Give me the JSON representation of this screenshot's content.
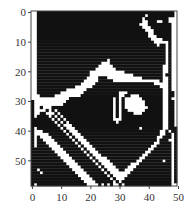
{
  "chart_data": {
    "type": "heatmap",
    "title": "",
    "xlabel": "",
    "ylabel": "",
    "colormap": "binary (black = 1, white = 0)",
    "colors": {
      "on": "#111111",
      "off": "#ffffff",
      "frame": "#444444"
    },
    "shape": [
      59,
      50
    ],
    "xlim": [
      -0.5,
      49.5
    ],
    "ylim": [
      58.5,
      -0.5
    ],
    "x_ticks": [
      0,
      10,
      20,
      30,
      40,
      50
    ],
    "y_ticks": [
      0,
      10,
      20,
      30,
      40,
      50
    ],
    "x_tick_labels": [
      "0",
      "10",
      "20",
      "30",
      "40",
      "50"
    ],
    "y_tick_labels": [
      "0",
      "10",
      "20",
      "30",
      "40",
      "50"
    ],
    "grid": false,
    "legend": null,
    "rows": [
      "00111111111111111111111111111111111111111111111110",
      "00111111111111111111111111111111111111101111111110",
      "00111111111111111111111111111111111111011111111000",
      "00111111111111111111111111111111111111001110011000",
      "00111111111111111111111111111111111110001111111100",
      "00111111111111111111111111111111111111000111111100",
      "00111111111111111111111111111111111111100011111100",
      "00111111111111111111111111111111111111110011111100",
      "00111111111111111111111111111111111111110001111100",
      "00111111111111111111111111111111111111111000011100",
      "00111111111111111111111111111111111111111100000100",
      "00111111111111111111111111111111111111111110110100",
      "00111111111111111111111111111111111111111111110100",
      "00111111111111111111111111111111111111111111110100",
      "00111111111111111111111111111111111111111111110100",
      "00111111111111111111111111111111111111111111110100",
      "00111111111111111111111111011111111111111111110100",
      "00111111111111111111111100011111111111111111110100",
      "00111111111111111111111000001111111111111111100100",
      "00111111111111111111110000000111111111111111100100",
      "00111111111111111111000000000000111111111111100100",
      "00111111111111111111000000000000000111111111101100",
      "00111111111111111110000111000000000000111111100100",
      "00111111111111111100000111110000000000000000100100",
      "00111111111111111000001111111111111111111100000100",
      "00111111111111100000011111111111111111111111000100",
      "00111111111100000001111111111111111111111111100100",
      "00111111110000000011111111111100011111111111100110",
      "00011111000000000111111111111100110001111111100110",
      "00000000000001111111111111110101000000111111100100",
      "10000000000011111111111111110101000000011111100110",
      "10000000000111111111111111110101000000011111100110",
      "10010001111111111111111111110101000000001111100110",
      "10000101011111111111111111110101100000011111100110",
      "10011000101111111111111111110101111000111111100110",
      "10111101010111111111111111110101111111111111100110",
      "11111110101011111111111111110001111111111111100110",
      "11111111010101111111111111111011111111111111100110",
      "11111111101000111111111111111111111111111111100110",
      "10111111110100011111111111111111111110111111100111",
      "10001111111010001111111111111111111111111111001011",
      "10000011111101000111111111111111111111111111001101",
      "10100001111110100011111111111111111111111110011101",
      "10110000111111010001111111111111111111111110111001",
      "10111000011111101000111111111111111111111100111101",
      "10111100001111110100011111111111111111111001111101",
      "11111110000111111010001111111111111111110011111101",
      "11111111000011111101000111111111111111100111111101",
      "11111111100001111110100011111111111111001111111101",
      "11111111110000111111010000111111111110011111111101",
      "11111111111000011111101000011111111100111111101101",
      "11111111111100001111110100001111110001111111111101",
      "11111111111110000111111010000111100011111111111101",
      "11011111111111000011111101000011000111111111111101",
      "11101111111111100001111110100000001111111111111101",
      "11111111111111110000111111010000011111111111111101",
      "11111111111111111000011111101000111111111111111101",
      "11111111111111111100001111110101111111111111111101",
      "10111111111111111110000101010010111111111111111100"
    ]
  }
}
